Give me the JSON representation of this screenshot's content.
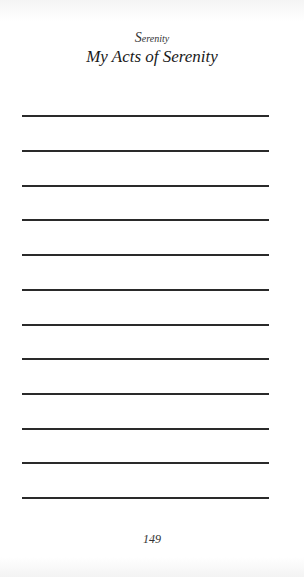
{
  "running_head": {
    "initial": "S",
    "rest": "erenity"
  },
  "title": "My Acts of Serenity",
  "lines": [
    {
      "y": 116
    },
    {
      "y": 151
    },
    {
      "y": 186
    },
    {
      "y": 220
    },
    {
      "y": 255
    },
    {
      "y": 290
    },
    {
      "y": 325
    },
    {
      "y": 359
    },
    {
      "y": 394
    },
    {
      "y": 429
    },
    {
      "y": 463
    },
    {
      "y": 498
    }
  ],
  "page_number": "149"
}
